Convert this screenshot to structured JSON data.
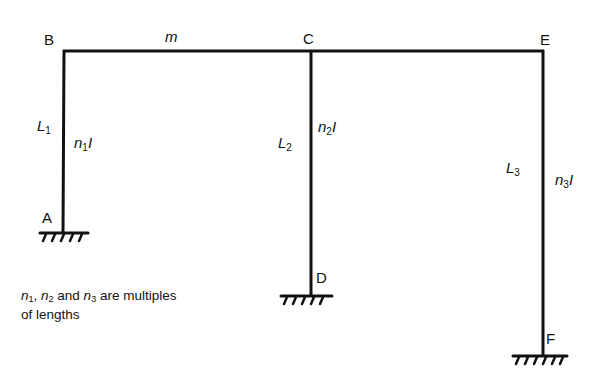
{
  "diagram": {
    "type": "portal-frame",
    "nodes": {
      "A": {
        "label": "A",
        "support": "fixed"
      },
      "B": {
        "label": "B"
      },
      "C": {
        "label": "C"
      },
      "D": {
        "label": "D",
        "support": "fixed"
      },
      "E": {
        "label": "E"
      },
      "F": {
        "label": "F",
        "support": "fixed"
      }
    },
    "beam": {
      "label": "m",
      "from": "B",
      "to": "E"
    },
    "columns": [
      {
        "name": "AB",
        "length_label": "L",
        "length_sub": "1",
        "stiffness_label": "n",
        "stiffness_sub": "1",
        "stiffness_suffix": "I"
      },
      {
        "name": "CD",
        "length_label": "L",
        "length_sub": "2",
        "stiffness_label": "n",
        "stiffness_sub": "2",
        "stiffness_suffix": "I"
      },
      {
        "name": "EF",
        "length_label": "L",
        "length_sub": "3",
        "stiffness_label": "n",
        "stiffness_sub": "3",
        "stiffness_suffix": "I"
      }
    ],
    "note": {
      "n1": "n",
      "n1_sub": "1",
      "sep1": ", ",
      "n2": "n",
      "n2_sub": "2",
      "sep2": " and ",
      "n3": "n",
      "n3_sub": "3",
      "line1_tail": " are multiples",
      "line2": "of lengths"
    },
    "colors": {
      "line": "#111111",
      "background": "#ffffff"
    }
  }
}
